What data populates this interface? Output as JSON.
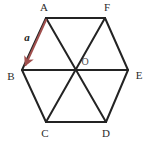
{
  "figure": {
    "background_color": "#ffffff",
    "edge_color": "#232323",
    "edge_width": 2,
    "diagonal_color": "#232323",
    "diagonal_width": 2,
    "vector_color": "#a0504e",
    "vector_width": 2,
    "label_color": "#2b2b2b",
    "center_label_color": "#4a4a4a"
  },
  "vertices": [
    {
      "id": "A",
      "label": "A",
      "x": 46,
      "y": 18,
      "label_x": 44,
      "label_y": 8,
      "anchor": "middle"
    },
    {
      "id": "F",
      "label": "F",
      "x": 105,
      "y": 18,
      "label_x": 107,
      "label_y": 8,
      "anchor": "middle"
    },
    {
      "id": "E",
      "label": "E",
      "x": 128,
      "y": 70,
      "label_x": 139,
      "label_y": 76,
      "anchor": "middle"
    },
    {
      "id": "D",
      "label": "D",
      "x": 106,
      "y": 122,
      "label_x": 106,
      "label_y": 134,
      "anchor": "middle"
    },
    {
      "id": "C",
      "label": "C",
      "x": 46,
      "y": 122,
      "label_x": 45,
      "label_y": 134,
      "anchor": "middle"
    },
    {
      "id": "B",
      "label": "B",
      "x": 22,
      "y": 70,
      "label_x": 11,
      "label_y": 77,
      "anchor": "middle"
    }
  ],
  "center": {
    "id": "O",
    "label": "O",
    "x": 75,
    "y": 70,
    "label_x": 85,
    "label_y": 63
  },
  "edges": [
    {
      "name": "edge-AF",
      "from": "A",
      "to": "F"
    },
    {
      "name": "edge-FE",
      "from": "F",
      "to": "E"
    },
    {
      "name": "edge-ED",
      "from": "E",
      "to": "D"
    },
    {
      "name": "edge-DC",
      "from": "D",
      "to": "C"
    },
    {
      "name": "edge-CB",
      "from": "C",
      "to": "B"
    },
    {
      "name": "edge-BA",
      "from": "B",
      "to": "A"
    }
  ],
  "diagonals": [
    {
      "name": "diagonal-AD",
      "from": "A",
      "to": "D"
    },
    {
      "name": "diagonal-BE",
      "from": "B",
      "to": "E"
    },
    {
      "name": "diagonal-CF",
      "from": "C",
      "to": "F"
    }
  ],
  "vector": {
    "name": "vector-a",
    "label": "a",
    "from": "A",
    "to": "B",
    "x1": 46,
    "y1": 20,
    "x2": 24,
    "y2": 68,
    "label_x": 27,
    "label_y": 38,
    "color": "#a0504e"
  }
}
